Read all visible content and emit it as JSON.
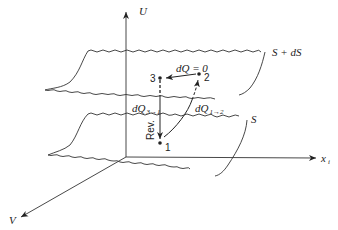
{
  "diagram": {
    "axes": {
      "vertical": "U",
      "horizontal": "x",
      "horizontal_subscript": "i",
      "depth": "V"
    },
    "surfaces": {
      "upper": "S + dS",
      "lower": "S"
    },
    "points": [
      {
        "id": "1",
        "label": "1"
      },
      {
        "id": "2",
        "label": "2"
      },
      {
        "id": "3",
        "label": "3"
      }
    ],
    "arrows": {
      "two_to_three": "dQ = 0",
      "one_to_two_main": "dQ",
      "one_to_two_sub": "1→2",
      "three_to_one_main": "dQ",
      "three_to_one_sub": "3→1",
      "reversible": "Rev."
    },
    "colors": {
      "ink": "#222222",
      "background": "#ffffff"
    }
  }
}
